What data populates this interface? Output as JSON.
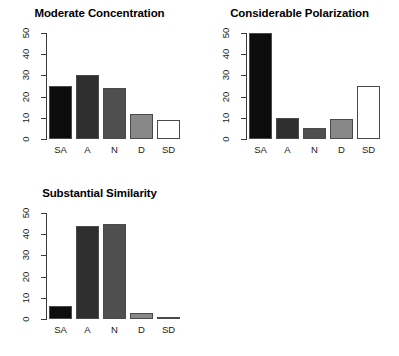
{
  "figure": {
    "layout": "2x2-grid-last-empty",
    "background": "#ffffff"
  },
  "palette": {
    "bar_fills": [
      "#0d0d0d",
      "#2f2f2f",
      "#4f4f4f",
      "#888888",
      "#ffffff"
    ],
    "bar_border": "#4a4a4a",
    "axis": "#3a3a3a",
    "text": "#000000"
  },
  "chart_data": [
    {
      "type": "bar",
      "title": "Moderate Concentration",
      "categories": [
        "SA",
        "A",
        "N",
        "D",
        "SD"
      ],
      "values": [
        25,
        30,
        24,
        12,
        9
      ],
      "xlabel": "",
      "ylabel": "",
      "ylim": [
        0,
        50
      ],
      "yticks": [
        0,
        10,
        20,
        30,
        40,
        50
      ],
      "grid": false,
      "legend": "none"
    },
    {
      "type": "bar",
      "title": "Considerable Polarization",
      "categories": [
        "SA",
        "A",
        "N",
        "D",
        "SD"
      ],
      "values": [
        50,
        10,
        5,
        9.5,
        25
      ],
      "xlabel": "",
      "ylabel": "",
      "ylim": [
        0,
        50
      ],
      "yticks": [
        0,
        10,
        20,
        30,
        40,
        50
      ],
      "grid": false,
      "legend": "none"
    },
    {
      "type": "bar",
      "title": "Substantial Similarity",
      "categories": [
        "SA",
        "A",
        "N",
        "D",
        "SD"
      ],
      "values": [
        6,
        44,
        45,
        3,
        0.5
      ],
      "xlabel": "",
      "ylabel": "",
      "ylim": [
        0,
        50
      ],
      "yticks": [
        0,
        10,
        20,
        30,
        40,
        50
      ],
      "grid": false,
      "legend": "none"
    }
  ]
}
